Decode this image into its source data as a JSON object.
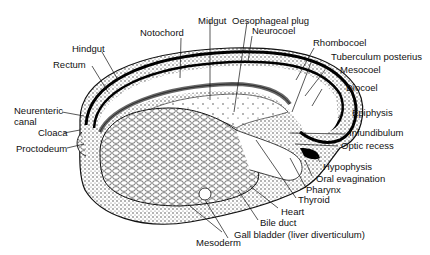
{
  "diagram": {
    "labels": {
      "midgut": "Midgut",
      "notochord": "Notochord",
      "oesophageal_plug": "Oesophageal plug",
      "neurocoel": "Neurocoel",
      "hindgut": "Hindgut",
      "rectum": "Rectum",
      "rhombocoel": "Rhombocoel",
      "tuberculum_posterius": "Tuberculum posterius",
      "mesocoel": "Mesocoel",
      "diocoel": "Diocoel",
      "epiphysis": "Epiphysis",
      "neurenteric_canal_1": "Neurenteric",
      "neurenteric_canal_2": "canal",
      "cloaca": "Cloaca",
      "proctodeum": "Proctodeum",
      "infundibulum": "Infundibulum",
      "optic_recess": "Optic recess",
      "hypophysis": "Hypophysis",
      "oral_evagination": "Oral evagination",
      "pharynx": "Pharynx",
      "thyroid": "Thyroid",
      "heart": "Heart",
      "bile_duct": "Bile duct",
      "mesoderm": "Mesoderm",
      "gall_bladder": "Gall bladder  (liver diverticulum)"
    }
  }
}
